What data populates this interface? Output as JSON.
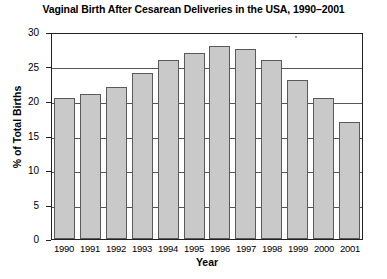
{
  "chart_data": {
    "type": "bar",
    "title": "Vaginal Birth After Cesarean Deliveries in the USA, 1990–2001",
    "xlabel": "Year",
    "ylabel": "% of Total Births",
    "categories": [
      "1990",
      "1991",
      "1992",
      "1993",
      "1994",
      "1995",
      "1996",
      "1997",
      "1998",
      "1999",
      "2000",
      "2001"
    ],
    "values": [
      20.4,
      21.0,
      22.0,
      24.0,
      26.0,
      27.0,
      28.0,
      27.5,
      26.0,
      23.0,
      20.5,
      17.0
    ],
    "ylim": [
      0,
      30
    ],
    "yticks": [
      0,
      5,
      10,
      15,
      20,
      25,
      30
    ],
    "ytick_labels": [
      "0",
      "5",
      "10",
      "15",
      "20",
      "25",
      "30"
    ],
    "gridlines": [
      5,
      10,
      15,
      20,
      25
    ],
    "grid": true,
    "legend": null,
    "bar_color": "#c9c9c9",
    "bar_border_color": "#5a5a5a",
    "axis_color": "#222222",
    "background_color": "#ffffff"
  }
}
